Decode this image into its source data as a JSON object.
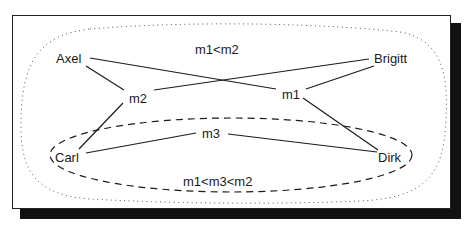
{
  "diagram": {
    "nodes": {
      "axel": "Axel",
      "brigitt": "Brigitt",
      "carl": "Carl",
      "dirk": "Dirk",
      "m1": "m1",
      "m2": "m2",
      "m3": "m3"
    },
    "regions": {
      "outer_label": "m1<m2",
      "inner_label": "m1<m3<m2"
    },
    "edges": [
      [
        "Axel",
        "m1"
      ],
      [
        "Axel",
        "m2"
      ],
      [
        "Brigitt",
        "m2"
      ],
      [
        "Brigitt",
        "m1"
      ],
      [
        "Carl",
        "m2"
      ],
      [
        "Carl",
        "m3"
      ],
      [
        "Dirk",
        "m3"
      ],
      [
        "Dirk",
        "m1"
      ]
    ],
    "colors": {
      "line": "#1a1a1a",
      "shadow": "#111111",
      "background": "#ffffff"
    }
  }
}
